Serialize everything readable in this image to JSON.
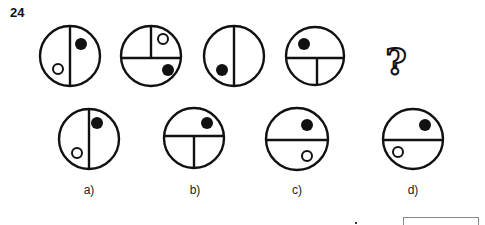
{
  "question": {
    "number": "24",
    "missing_symbol": "?"
  },
  "sequence": [
    {
      "id": "seq-1",
      "cx": 70,
      "cy": 56,
      "r": 30,
      "lines": [
        {
          "x1": 70,
          "y1": 26,
          "x2": 70,
          "y2": 86
        }
      ],
      "filled_dots": [
        {
          "cx": 81,
          "cy": 44,
          "r": 6
        }
      ],
      "open_dots": [
        {
          "cx": 58,
          "cy": 69,
          "r": 5
        }
      ]
    },
    {
      "id": "seq-2",
      "cx": 151,
      "cy": 56,
      "r": 30,
      "lines": [
        {
          "x1": 121,
          "y1": 58,
          "x2": 181,
          "y2": 58
        },
        {
          "x1": 151,
          "y1": 26,
          "x2": 151,
          "y2": 58
        }
      ],
      "filled_dots": [
        {
          "cx": 168,
          "cy": 70,
          "r": 6
        }
      ],
      "open_dots": [
        {
          "cx": 163,
          "cy": 39,
          "r": 5
        }
      ]
    },
    {
      "id": "seq-3",
      "cx": 234,
      "cy": 56,
      "r": 30,
      "lines": [
        {
          "x1": 234,
          "y1": 26,
          "x2": 234,
          "y2": 86
        }
      ],
      "filled_dots": [
        {
          "cx": 222,
          "cy": 70,
          "r": 6
        }
      ],
      "open_dots": []
    },
    {
      "id": "seq-4",
      "cx": 315,
      "cy": 56,
      "r": 29,
      "lines": [
        {
          "x1": 286,
          "y1": 58,
          "x2": 344,
          "y2": 58
        },
        {
          "x1": 317,
          "y1": 58,
          "x2": 317,
          "y2": 85
        }
      ],
      "filled_dots": [
        {
          "cx": 304,
          "cy": 44,
          "r": 6
        }
      ],
      "open_dots": []
    }
  ],
  "options": [
    {
      "id": "a",
      "label": "a)",
      "label_x": 89,
      "cx": 89,
      "cy": 139,
      "r": 30,
      "lines": [
        {
          "x1": 89,
          "y1": 109,
          "x2": 89,
          "y2": 169
        }
      ],
      "filled_dots": [
        {
          "cx": 97,
          "cy": 123,
          "r": 6
        }
      ],
      "open_dots": [
        {
          "cx": 77,
          "cy": 153,
          "r": 5
        }
      ]
    },
    {
      "id": "b",
      "label": "b)",
      "label_x": 195,
      "cx": 194,
      "cy": 138,
      "r": 30,
      "lines": [
        {
          "x1": 164,
          "y1": 136,
          "x2": 224,
          "y2": 136
        },
        {
          "x1": 194,
          "y1": 136,
          "x2": 194,
          "y2": 168
        }
      ],
      "filled_dots": [
        {
          "cx": 207,
          "cy": 123,
          "r": 6
        }
      ],
      "open_dots": []
    },
    {
      "id": "c",
      "label": "c)",
      "label_x": 297,
      "cx": 297,
      "cy": 139,
      "r": 31,
      "lines": [
        {
          "x1": 266,
          "y1": 140,
          "x2": 328,
          "y2": 140
        }
      ],
      "filled_dots": [
        {
          "cx": 307,
          "cy": 125,
          "r": 6
        }
      ],
      "open_dots": [
        {
          "cx": 307,
          "cy": 156,
          "r": 5
        }
      ]
    },
    {
      "id": "d",
      "label": "d)",
      "label_x": 413,
      "cx": 413,
      "cy": 139,
      "r": 30,
      "lines": [
        {
          "x1": 383,
          "y1": 140,
          "x2": 443,
          "y2": 140
        }
      ],
      "filled_dots": [
        {
          "cx": 425,
          "cy": 125,
          "r": 6
        }
      ],
      "open_dots": [
        {
          "cx": 398,
          "cy": 152,
          "r": 5
        }
      ]
    }
  ],
  "colors": {
    "stroke": "#111111",
    "background": "#ffffff"
  }
}
